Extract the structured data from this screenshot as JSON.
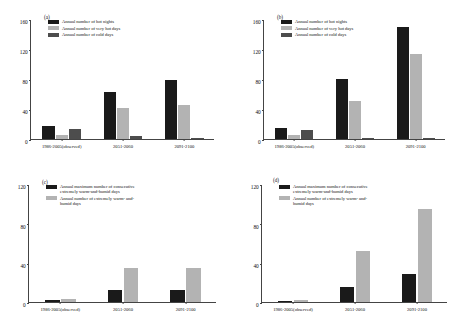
{
  "figure": {
    "panels": [
      "a",
      "b",
      "c",
      "d"
    ],
    "categories": [
      "1986-2005(observed)",
      "2051-2060",
      "2091-2100"
    ],
    "colors": {
      "black": "#1a1a1a",
      "light_gray": "#b3b3b3",
      "dark_gray": "#4d4d4d",
      "axis": "#444444"
    }
  },
  "chart_data": [
    {
      "type": "bar",
      "panel": "a",
      "title": "(a)",
      "xlabel": "",
      "ylabel": "",
      "ylim": [
        0,
        160
      ],
      "yticks": [
        0,
        40,
        80,
        120,
        160
      ],
      "ytick_labels": [
        "0",
        "40",
        "80",
        "120",
        "160"
      ],
      "grid": false,
      "legend_position": "upper-left",
      "categories": [
        "1986-2005(observed)",
        "2051-2060",
        "2091-2100"
      ],
      "series": [
        {
          "name": "Annual number of hot nights",
          "color": "#1a1a1a",
          "values": [
            17,
            63,
            79
          ]
        },
        {
          "name": "Annual number of very hot days",
          "color": "#b3b3b3",
          "values": [
            6,
            41,
            45
          ]
        },
        {
          "name": "Annual number of cold days",
          "color": "#4d4d4d",
          "values": [
            14,
            4,
            1
          ]
        }
      ]
    },
    {
      "type": "bar",
      "panel": "b",
      "title": "(b)",
      "xlabel": "",
      "ylabel": "",
      "ylim": [
        0,
        160
      ],
      "yticks": [
        0,
        40,
        80,
        120,
        160
      ],
      "ytick_labels": [
        "0",
        "40",
        "80",
        "120",
        "160"
      ],
      "grid": false,
      "legend_position": "upper-left",
      "categories": [
        "1986-2005(observed)",
        "2051-2060",
        "2091-2100"
      ],
      "series": [
        {
          "name": "Annual number of hot nights",
          "color": "#1a1a1a",
          "values": [
            15,
            80,
            150
          ]
        },
        {
          "name": "Annual number of very hot days",
          "color": "#b3b3b3",
          "values": [
            5,
            51,
            113
          ]
        },
        {
          "name": "Annual number of cold days",
          "color": "#4d4d4d",
          "values": [
            12,
            2,
            0.5
          ]
        }
      ]
    },
    {
      "type": "bar",
      "panel": "c",
      "title": "(c)",
      "xlabel": "",
      "ylabel": "",
      "ylim": [
        0,
        120
      ],
      "yticks": [
        0,
        40,
        80,
        120
      ],
      "ytick_labels": [
        "0",
        "40",
        "80",
        "120"
      ],
      "grid": false,
      "legend_position": "upper-left",
      "categories": [
        "1986-2005(observed)",
        "2051-2060",
        "2091-2100"
      ],
      "series": [
        {
          "name": "Annual maximum number of consecutive\nextremely warm-and-humid days",
          "color": "#1a1a1a",
          "values": [
            2,
            12,
            12
          ]
        },
        {
          "name": "Annual number of extremely warm- and-\nhumid days",
          "color": "#b3b3b3",
          "values": [
            3,
            35,
            35
          ]
        }
      ]
    },
    {
      "type": "bar",
      "panel": "d",
      "title": "(d)",
      "xlabel": "",
      "ylabel": "",
      "ylim": [
        0,
        120
      ],
      "yticks": [
        0,
        40,
        80,
        120
      ],
      "ytick_labels": [
        "0",
        "40",
        "80",
        "120"
      ],
      "grid": false,
      "legend_position": "upper-left",
      "categories": [
        "1986-2005(observed)",
        "2051-2060",
        "2091-2100"
      ],
      "series": [
        {
          "name": "Annual maximum number of consecutive\nextremely warm-and-humid days",
          "color": "#1a1a1a",
          "values": [
            1.5,
            15,
            28
          ]
        },
        {
          "name": "Annual number of extremely warm- and-\nhumid days",
          "color": "#b3b3b3",
          "values": [
            2,
            52,
            95
          ]
        }
      ]
    }
  ]
}
